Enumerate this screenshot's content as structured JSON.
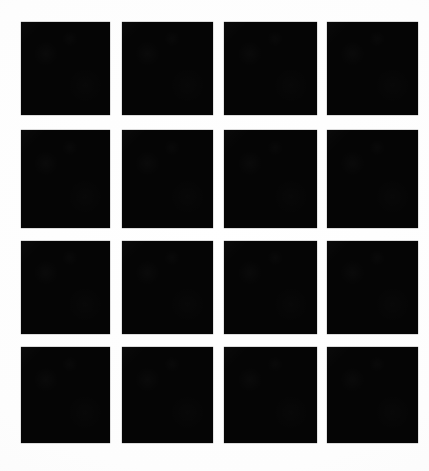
{
  "image": {
    "kind": "grid-pattern",
    "description": "4 by 4 grid of solid black squares on a white background",
    "width": 429,
    "height": 471,
    "background_color": "#fefefe",
    "patch_color": "#050505",
    "rows": 4,
    "columns": 4,
    "patch_count": 16
  },
  "geometry": {
    "column_x": [
      21,
      122,
      224,
      327
    ],
    "column_width": [
      89,
      91,
      93,
      91
    ],
    "row_y": [
      22,
      130,
      241,
      347
    ],
    "row_height": [
      93,
      98,
      93,
      96
    ],
    "column_gap": [
      12,
      11,
      10
    ],
    "row_gap": [
      15,
      13,
      13
    ],
    "margin_left": 21,
    "margin_top": 22,
    "margin_right": 11,
    "margin_bottom": 28
  },
  "patches": [
    {
      "id": "patch-r1-c1",
      "row": 1,
      "col": 1,
      "x": 21,
      "y": 22,
      "w": 89,
      "h": 93,
      "color": "#050505"
    },
    {
      "id": "patch-r1-c2",
      "row": 1,
      "col": 2,
      "x": 122,
      "y": 22,
      "w": 91,
      "h": 93,
      "color": "#050505"
    },
    {
      "id": "patch-r1-c3",
      "row": 1,
      "col": 3,
      "x": 224,
      "y": 22,
      "w": 93,
      "h": 93,
      "color": "#050505"
    },
    {
      "id": "patch-r1-c4",
      "row": 1,
      "col": 4,
      "x": 327,
      "y": 22,
      "w": 91,
      "h": 93,
      "color": "#050505"
    },
    {
      "id": "patch-r2-c1",
      "row": 2,
      "col": 1,
      "x": 21,
      "y": 130,
      "w": 89,
      "h": 98,
      "color": "#050505"
    },
    {
      "id": "patch-r2-c2",
      "row": 2,
      "col": 2,
      "x": 122,
      "y": 130,
      "w": 91,
      "h": 98,
      "color": "#050505"
    },
    {
      "id": "patch-r2-c3",
      "row": 2,
      "col": 3,
      "x": 224,
      "y": 130,
      "w": 93,
      "h": 98,
      "color": "#050505"
    },
    {
      "id": "patch-r2-c4",
      "row": 2,
      "col": 4,
      "x": 327,
      "y": 130,
      "w": 91,
      "h": 98,
      "color": "#050505"
    },
    {
      "id": "patch-r3-c1",
      "row": 3,
      "col": 1,
      "x": 21,
      "y": 241,
      "w": 89,
      "h": 93,
      "color": "#050505"
    },
    {
      "id": "patch-r3-c2",
      "row": 3,
      "col": 2,
      "x": 122,
      "y": 241,
      "w": 91,
      "h": 93,
      "color": "#050505"
    },
    {
      "id": "patch-r3-c3",
      "row": 3,
      "col": 3,
      "x": 224,
      "y": 241,
      "w": 93,
      "h": 93,
      "color": "#050505"
    },
    {
      "id": "patch-r3-c4",
      "row": 3,
      "col": 4,
      "x": 327,
      "y": 241,
      "w": 91,
      "h": 93,
      "color": "#050505"
    },
    {
      "id": "patch-r4-c1",
      "row": 4,
      "col": 1,
      "x": 21,
      "y": 347,
      "w": 89,
      "h": 96,
      "color": "#050505"
    },
    {
      "id": "patch-r4-c2",
      "row": 4,
      "col": 2,
      "x": 122,
      "y": 347,
      "w": 91,
      "h": 96,
      "color": "#050505"
    },
    {
      "id": "patch-r4-c3",
      "row": 4,
      "col": 3,
      "x": 224,
      "y": 347,
      "w": 93,
      "h": 96,
      "color": "#050505"
    },
    {
      "id": "patch-r4-c4",
      "row": 4,
      "col": 4,
      "x": 327,
      "y": 347,
      "w": 91,
      "h": 96,
      "color": "#050505"
    }
  ]
}
